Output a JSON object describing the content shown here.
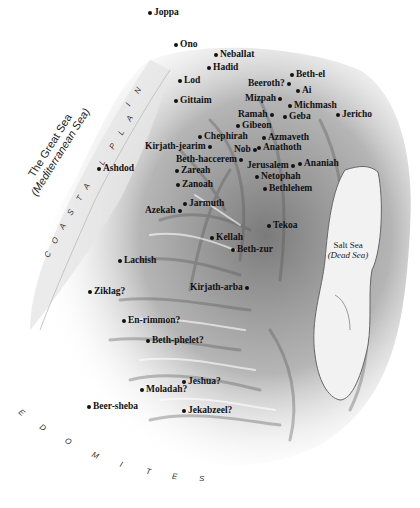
{
  "map": {
    "seas": {
      "great_sea": {
        "line1": "The Great Sea",
        "line2": "(Mediterranean Sea)"
      },
      "salt_sea": {
        "line1": "Salt Sea",
        "line2": "(Dead Sea)"
      }
    },
    "regions": {
      "coastal_plain": [
        "C",
        "O",
        "A",
        "S",
        "T",
        "A",
        "L",
        "P",
        "L",
        "A",
        "I",
        "N"
      ],
      "edomites": [
        "E",
        "D",
        "O",
        "M",
        "I",
        "T",
        "E",
        "S"
      ]
    },
    "places": [
      {
        "name": "Joppa",
        "x": 148,
        "y": 8,
        "dot": "left"
      },
      {
        "name": "Ono",
        "x": 174,
        "y": 40,
        "dot": "left"
      },
      {
        "name": "Neballat",
        "x": 214,
        "y": 50,
        "dot": "left"
      },
      {
        "name": "Hadid",
        "x": 207,
        "y": 63,
        "dot": "left"
      },
      {
        "name": "Lod",
        "x": 178,
        "y": 76,
        "dot": "left"
      },
      {
        "name": "Beth-el",
        "x": 290,
        "y": 70,
        "dot": "left"
      },
      {
        "name": "Beeroth?",
        "x": 248,
        "y": 79,
        "dot": "right"
      },
      {
        "name": "Ai",
        "x": 296,
        "y": 86,
        "dot": "left"
      },
      {
        "name": "Gittaim",
        "x": 174,
        "y": 96,
        "dot": "left"
      },
      {
        "name": "Mizpah",
        "x": 245,
        "y": 94,
        "dot": "right"
      },
      {
        "name": "Michmash",
        "x": 288,
        "y": 101,
        "dot": "left"
      },
      {
        "name": "Ramah",
        "x": 238,
        "y": 110,
        "dot": "right"
      },
      {
        "name": "Geba",
        "x": 283,
        "y": 112,
        "dot": "left"
      },
      {
        "name": "Jericho",
        "x": 336,
        "y": 110,
        "dot": "left"
      },
      {
        "name": "Gibeon",
        "x": 236,
        "y": 121,
        "dot": "left"
      },
      {
        "name": "Chephirah",
        "x": 198,
        "y": 132,
        "dot": "left"
      },
      {
        "name": "Azmaveth",
        "x": 262,
        "y": 133,
        "dot": "left"
      },
      {
        "name": "Kirjath-jearim",
        "x": 145,
        "y": 142,
        "dot": "right"
      },
      {
        "name": "Nob",
        "x": 234,
        "y": 145,
        "dot": "right"
      },
      {
        "name": "Anathoth",
        "x": 257,
        "y": 143,
        "dot": "left"
      },
      {
        "name": "Beth-haccerem",
        "x": 176,
        "y": 155,
        "dot": "right"
      },
      {
        "name": "Jerusalem",
        "x": 247,
        "y": 161,
        "dot": "right"
      },
      {
        "name": "Ananiah",
        "x": 298,
        "y": 159,
        "dot": "left"
      },
      {
        "name": "Zareah",
        "x": 175,
        "y": 166,
        "dot": "left"
      },
      {
        "name": "Netophah",
        "x": 255,
        "y": 172,
        "dot": "left"
      },
      {
        "name": "Ashdod",
        "x": 97,
        "y": 164,
        "dot": "left"
      },
      {
        "name": "Zanoah",
        "x": 176,
        "y": 180,
        "dot": "left"
      },
      {
        "name": "Bethlehem",
        "x": 263,
        "y": 184,
        "dot": "left"
      },
      {
        "name": "Jarmuth",
        "x": 183,
        "y": 199,
        "dot": "left"
      },
      {
        "name": "Azekah",
        "x": 145,
        "y": 206,
        "dot": "right"
      },
      {
        "name": "Tekoa",
        "x": 267,
        "y": 221,
        "dot": "left"
      },
      {
        "name": "Kellah",
        "x": 210,
        "y": 233,
        "dot": "left"
      },
      {
        "name": "Beth-zur",
        "x": 231,
        "y": 245,
        "dot": "left"
      },
      {
        "name": "Lachish",
        "x": 118,
        "y": 256,
        "dot": "left"
      },
      {
        "name": "Kirjath-arba",
        "x": 190,
        "y": 283,
        "dot": "right"
      },
      {
        "name": "Ziklag?",
        "x": 88,
        "y": 287,
        "dot": "left"
      },
      {
        "name": "En-rimmon?",
        "x": 122,
        "y": 316,
        "dot": "left"
      },
      {
        "name": "Beth-phelet?",
        "x": 146,
        "y": 336,
        "dot": "left"
      },
      {
        "name": "Jeshua?",
        "x": 182,
        "y": 377,
        "dot": "left"
      },
      {
        "name": "Moladah?",
        "x": 140,
        "y": 385,
        "dot": "left"
      },
      {
        "name": "Beer-sheba",
        "x": 87,
        "y": 402,
        "dot": "left"
      },
      {
        "name": "Jekabzeel?",
        "x": 182,
        "y": 406,
        "dot": "left"
      }
    ]
  }
}
